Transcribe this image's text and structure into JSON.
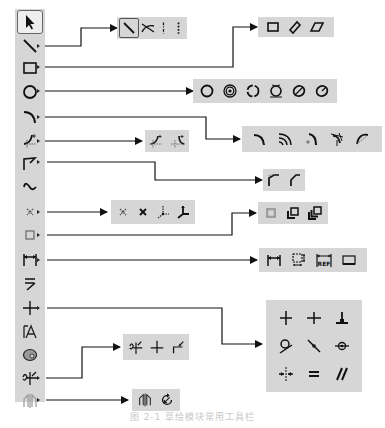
{
  "diagram": {
    "caption": "图 2-1  草绘模块常用工具栏"
  },
  "toolbar": {
    "items": [
      {
        "name": "select",
        "icon": "arrow-pointer-icon",
        "has_flyout": false,
        "selected": true
      },
      {
        "name": "line",
        "icon": "line-icon",
        "has_flyout": true
      },
      {
        "name": "rectangle",
        "icon": "rectangle-icon",
        "has_flyout": true
      },
      {
        "name": "circle",
        "icon": "circle-icon",
        "has_flyout": true
      },
      {
        "name": "arc",
        "icon": "arc-icon",
        "has_flyout": true
      },
      {
        "name": "fillet",
        "icon": "fillet-icon",
        "has_flyout": true
      },
      {
        "name": "chamfer",
        "icon": "chamfer-icon",
        "has_flyout": true
      },
      {
        "name": "spline",
        "icon": "spline-icon",
        "has_flyout": false
      },
      {
        "name": "point",
        "icon": "point-icon",
        "has_flyout": true
      },
      {
        "name": "offset",
        "icon": "offset-icon",
        "has_flyout": true
      },
      {
        "name": "dimension",
        "icon": "dimension-icon",
        "has_flyout": true
      },
      {
        "name": "modify",
        "icon": "modify-icon",
        "has_flyout": false
      },
      {
        "name": "constraint",
        "icon": "constraint-icon",
        "has_flyout": true
      },
      {
        "name": "text",
        "icon": "text-icon",
        "has_flyout": false
      },
      {
        "name": "palette",
        "icon": "palette-icon",
        "has_flyout": false
      },
      {
        "name": "trim",
        "icon": "trim-icon",
        "has_flyout": true
      },
      {
        "name": "mirror",
        "icon": "mirror-icon",
        "has_flyout": true
      }
    ]
  },
  "flyouts": {
    "line": {
      "items": [
        "line-icon",
        "tangent-line-icon",
        "centerline-icon",
        "geometry-centerline-icon"
      ]
    },
    "rectangle": {
      "items": [
        "rectangle-icon",
        "slanted-rectangle-icon",
        "parallelogram-icon"
      ]
    },
    "circle": {
      "items": [
        "circle-icon",
        "concentric-circle-icon",
        "3-point-circle-icon",
        "3-tangent-circle-icon",
        "axis-ellipse-icon",
        "center-ellipse-icon"
      ]
    },
    "fillet": {
      "items": [
        "circular-fillet-icon",
        "elliptical-fillet-icon"
      ]
    },
    "arc": {
      "items": [
        "3-point-arc-icon",
        "concentric-arc-icon",
        "center-arc-icon",
        "3-tangent-arc-icon",
        "conic-arc-icon"
      ]
    },
    "chamfer": {
      "items": [
        "chamfer-icon",
        "chamfer-trim-icon"
      ]
    },
    "point": {
      "items": [
        "point-icon",
        "geometry-point-icon",
        "coordinate-system-icon",
        "geometry-coordinate-system-icon"
      ]
    },
    "offset": {
      "items": [
        "use-edge-icon",
        "offset-edge-icon",
        "thicken-edge-icon"
      ]
    },
    "dimension": {
      "items": [
        "normal-dimension-icon",
        "perimeter-dimension-icon",
        "reference-dimension-icon",
        "baseline-icon"
      ],
      "ref_label": "REF"
    },
    "constraint": {
      "items": [
        "vertical-icon",
        "horizontal-icon",
        "perpendicular-icon",
        "tangent-icon",
        "midpoint-icon",
        "coincident-icon",
        "symmetric-icon",
        "equal-icon",
        "parallel-icon"
      ]
    },
    "trim": {
      "items": [
        "dynamic-trim-icon",
        "divide-icon",
        "corner-trim-icon"
      ]
    },
    "mirror": {
      "items": [
        "mirror-icon",
        "rotate-resize-icon"
      ]
    }
  }
}
